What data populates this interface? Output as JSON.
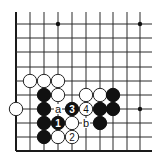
{
  "diagram": {
    "type": "go-board-fragment",
    "columns_x": [
      16,
      30,
      44,
      58,
      72,
      86,
      100,
      113,
      127,
      140
    ],
    "rows_y": [
      24,
      38,
      52,
      67,
      81,
      95,
      109,
      123,
      137,
      151
    ],
    "line_extent": {
      "top": 12,
      "right": 152
    },
    "edges": [
      "left",
      "bottom"
    ],
    "star_points": [
      {
        "col": 3,
        "row": 0
      },
      {
        "col": 9,
        "row": 0
      },
      {
        "col": 9,
        "row": 6
      }
    ],
    "stones": [
      {
        "col": 1,
        "row": 4,
        "color": "white",
        "label": ""
      },
      {
        "col": 2,
        "row": 4,
        "color": "white",
        "label": ""
      },
      {
        "col": 3,
        "row": 4,
        "color": "white",
        "label": ""
      },
      {
        "col": 2,
        "row": 5,
        "color": "black",
        "label": ""
      },
      {
        "col": 3,
        "row": 5,
        "color": "white",
        "label": ""
      },
      {
        "col": 5,
        "row": 5,
        "color": "white",
        "label": ""
      },
      {
        "col": 6,
        "row": 5,
        "color": "white",
        "label": ""
      },
      {
        "col": 7,
        "row": 5,
        "color": "black",
        "label": ""
      },
      {
        "col": 0,
        "row": 6,
        "color": "white",
        "label": ""
      },
      {
        "col": 2,
        "row": 6,
        "color": "black",
        "label": ""
      },
      {
        "col": 4,
        "row": 6,
        "color": "black",
        "label": "3"
      },
      {
        "col": 5,
        "row": 6,
        "color": "white",
        "label": "4"
      },
      {
        "col": 6,
        "row": 6,
        "color": "black",
        "label": ""
      },
      {
        "col": 7,
        "row": 6,
        "color": "black",
        "label": ""
      },
      {
        "col": 2,
        "row": 7,
        "color": "black",
        "label": ""
      },
      {
        "col": 3,
        "row": 7,
        "color": "black",
        "label": "1"
      },
      {
        "col": 4,
        "row": 7,
        "color": "white",
        "label": ""
      },
      {
        "col": 6,
        "row": 7,
        "color": "black",
        "label": ""
      },
      {
        "col": 2,
        "row": 8,
        "color": "black",
        "label": ""
      },
      {
        "col": 3,
        "row": 8,
        "color": "white",
        "label": ""
      },
      {
        "col": 4,
        "row": 8,
        "color": "white",
        "label": "2"
      }
    ],
    "markers": [
      {
        "col": 3,
        "row": 6,
        "label": "a"
      },
      {
        "col": 5,
        "row": 7,
        "label": "b"
      }
    ],
    "stone_radius": 7,
    "colors": {
      "black": "#111111",
      "white": "#ffffff",
      "line": "#2a2a2a"
    }
  }
}
